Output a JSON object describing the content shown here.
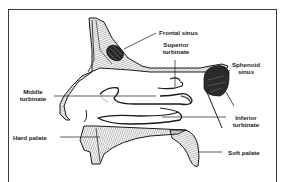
{
  "diagram": {
    "labels": {
      "frontal_sinus": "Frontal sinus",
      "superior_turbinate_1": "Superior",
      "superior_turbinate_2": "turbinate",
      "sphenoid_sinus_1": "Sphenoid",
      "sphenoid_sinus_2": "sinus",
      "middle_turbinate_1": "Middle",
      "middle_turbinate_2": "turbinate",
      "inferior_turbinate_1": "Inferior",
      "inferior_turbinate_2": "turbinate",
      "hard_palate": "Hard palate",
      "soft_palate": "Soft palate"
    },
    "colors": {
      "ink": "#1a1a1a",
      "frame": "#3a3a3a",
      "background": "#ffffff",
      "hatch": "#555555"
    }
  }
}
